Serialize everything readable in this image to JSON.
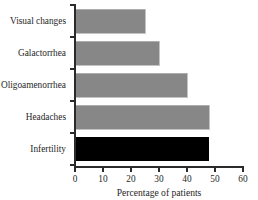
{
  "chart_data": {
    "type": "bar",
    "orientation": "horizontal",
    "title": "",
    "subtitle": "",
    "xlabel": "Percentage of patients",
    "ylabel": "",
    "categories": [
      "Visual changes",
      "Galactorrhea",
      "Oligoamenorrhea",
      "Headaches",
      "Infertility"
    ],
    "values": [
      13,
      25,
      30,
      40,
      48
    ],
    "xlim": [
      0,
      60
    ],
    "xticks": [
      0,
      10,
      20,
      30,
      40,
      50,
      60
    ],
    "xtick_labels": [
      "0",
      "10",
      "20",
      "30",
      "40",
      "50",
      "60"
    ],
    "grid": false,
    "legend": false,
    "legend_position": "none",
    "bar_color": "#878787",
    "bar_edge_color": "#b5b5b5",
    "axis_color": "#2b2b2b",
    "text_color": "#262626",
    "background_color": "#ffffff"
  }
}
